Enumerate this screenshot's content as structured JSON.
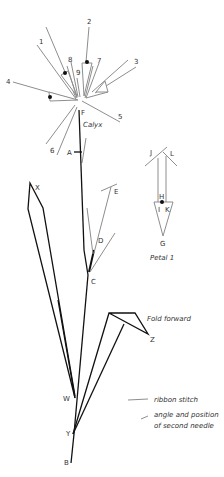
{
  "diagram": {
    "calyx": {
      "title": "Calyx",
      "center_label": "F",
      "strand_labels": [
        "1",
        "2",
        "3",
        "4",
        "5",
        "6",
        "7",
        "8",
        "9"
      ]
    },
    "stem_labels": {
      "a": "A",
      "b": "B",
      "c": "C",
      "d": "D",
      "e": "E",
      "w": "W",
      "x": "X",
      "y": "Y",
      "z": "Z"
    },
    "petal": {
      "title": "Petal 1",
      "labels": {
        "g": "G",
        "h": "H",
        "i": "I",
        "j": "J",
        "k": "K",
        "l": "L"
      }
    },
    "annotations": {
      "fold": "Fold forward"
    },
    "legend": {
      "items": [
        {
          "label": "ribbon stitch",
          "color": "#8e8e8e"
        },
        {
          "label_line1": "angle and position",
          "label_line2": "of second needle",
          "color": "#8e8e8e"
        }
      ]
    },
    "colors": {
      "ribbon": "#8e8e8e",
      "stem": "#111111",
      "text": "#333333"
    }
  }
}
